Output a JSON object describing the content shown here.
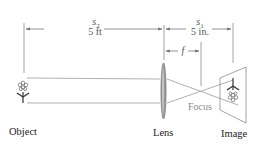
{
  "diagram": {
    "labels": {
      "object": "Object",
      "lens": "Lens",
      "image": "Image",
      "focus": "Focus"
    },
    "dimensions": {
      "s2_symbol": "s",
      "s2_subscript": "2",
      "s2_value": "5 ft",
      "s1_symbol": "s",
      "s1_subscript": "1",
      "s1_value": "5 in.",
      "f_symbol": "f"
    },
    "colors": {
      "line": "#9a9a9a",
      "lens": "#8c8c8c",
      "text": "#222222",
      "focus_text": "#8a8a8a"
    }
  }
}
